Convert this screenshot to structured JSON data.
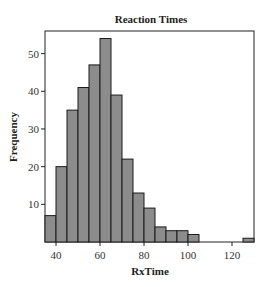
{
  "chart_data": {
    "type": "bar",
    "title": "Reaction Times",
    "xlabel": "RxTime",
    "ylabel": "Frequency",
    "bin_width": 5,
    "bin_edges": [
      35,
      40,
      45,
      50,
      55,
      60,
      65,
      70,
      75,
      80,
      85,
      90,
      95,
      100,
      105,
      110,
      115,
      120,
      125,
      130
    ],
    "categories": [
      "35-40",
      "40-45",
      "45-50",
      "50-55",
      "55-60",
      "60-65",
      "65-70",
      "70-75",
      "75-80",
      "80-85",
      "85-90",
      "90-95",
      "95-100",
      "100-105",
      "105-110",
      "110-115",
      "115-120",
      "120-125",
      "125-130"
    ],
    "values": [
      7,
      20,
      35,
      41,
      47,
      54,
      39,
      22,
      13,
      9,
      4,
      3,
      3,
      2,
      0,
      0,
      0,
      0,
      1
    ],
    "xlim": [
      35,
      130
    ],
    "ylim": [
      0,
      56
    ],
    "xticks": [
      40,
      60,
      80,
      100,
      120
    ],
    "yticks": [
      10,
      20,
      30,
      40,
      50
    ],
    "grid": false,
    "legend": null,
    "bar_fill": "#8c8c8c",
    "bar_stroke": "#1a1a1a"
  }
}
